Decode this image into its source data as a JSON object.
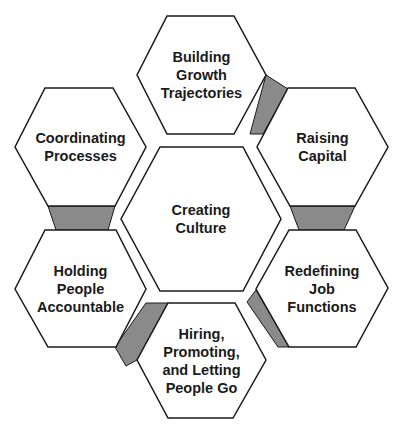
{
  "diagram": {
    "type": "hexagon-cycle",
    "colors": {
      "hex_fill": "#ffffff",
      "hex_stroke": "#1a1a1a",
      "connector_fill": "#8a8a8a",
      "text": "#1a1a1a"
    },
    "center": {
      "label": "Creating\nCulture"
    },
    "nodes": [
      {
        "id": "building",
        "label": "Building\nGrowth\nTrajectories"
      },
      {
        "id": "raising",
        "label": "Raising\nCapital"
      },
      {
        "id": "redefining",
        "label": "Redefining\nJob\nFunctions"
      },
      {
        "id": "hiring",
        "label": "Hiring,\nPromoting,\nand Letting\nPeople Go"
      },
      {
        "id": "holding",
        "label": "Holding\nPeople\nAccountable"
      },
      {
        "id": "coordinating",
        "label": "Coordinating\nProcesses"
      }
    ]
  },
  "footer": {
    "fragment": ""
  }
}
